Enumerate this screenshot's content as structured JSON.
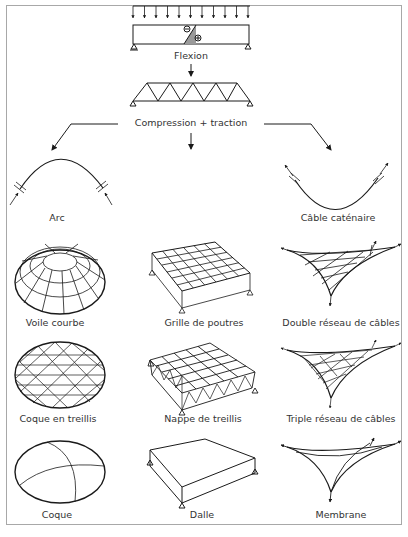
{
  "diagram": {
    "top": {
      "flexion_label": "Flexion",
      "compression_label": "Compression + traction",
      "beam_symbols": {
        "minus": "⊖",
        "plus": "⊕"
      }
    },
    "branches": {
      "left": "Arc",
      "right": "Câble caténaire"
    },
    "grid": {
      "columns": [
        "compression",
        "flexion",
        "traction"
      ],
      "rows": [
        [
          "Voile courbe",
          "Grille de poutres",
          "Double réseau de câbles"
        ],
        [
          "Coque en treillis",
          "Nappe de treillis",
          "Triple réseau de câbles"
        ],
        [
          "Coque",
          "Dalle",
          "Membrane"
        ]
      ]
    },
    "colors": {
      "line": "#1a1a1a",
      "frame": "#a8a8a8",
      "text": "#333333",
      "beam_shade": "#9a9a9a"
    }
  }
}
